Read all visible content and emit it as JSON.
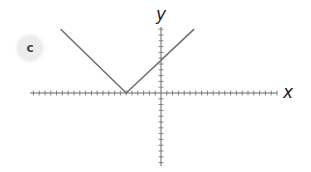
{
  "panel": {
    "badge_label": "c"
  },
  "chart_data": {
    "type": "line",
    "title": "",
    "xlabel": "x",
    "ylabel": "y",
    "function": "y = |x + 6|",
    "xlim": [
      -23,
      20
    ],
    "ylim": [
      -12,
      11
    ],
    "grid": false,
    "tick_spacing": 1,
    "tick_labels": false,
    "series": [
      {
        "name": "absolute value graph",
        "color": "#707070",
        "x": [
          -17.3,
          -6,
          5.7
        ],
        "y": [
          11,
          0,
          11
        ]
      }
    ],
    "vertex": [
      -6,
      0
    ],
    "y_intercept": 6
  },
  "style": {
    "axis_color": "#6a6a6a",
    "line_color": "#707070"
  }
}
